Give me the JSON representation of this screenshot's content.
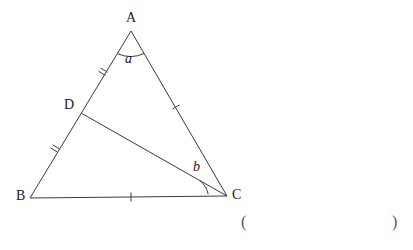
{
  "figure": {
    "kind": "geometry-triangle-diagram",
    "background_color": "#ffffff",
    "stroke_color": "#3a3a3a",
    "text_color": "#1a1a1a",
    "vertices": [
      {
        "name": "A",
        "label": "A",
        "x": 131,
        "y": 31
      },
      {
        "name": "B",
        "label": "B",
        "x": 30,
        "y": 198
      },
      {
        "name": "C",
        "label": "C",
        "x": 227,
        "y": 196
      },
      {
        "name": "D",
        "label": "D",
        "x": 81,
        "y": 113
      }
    ],
    "segments": [
      {
        "name": "AB",
        "from": "A",
        "to": "B"
      },
      {
        "name": "AC",
        "from": "A",
        "to": "C"
      },
      {
        "name": "BC",
        "from": "B",
        "to": "C"
      },
      {
        "name": "DC",
        "from": "D",
        "to": "C"
      }
    ],
    "tick_marks": [
      {
        "name": "tick-AD",
        "segment": "AD",
        "count": 2,
        "x": 103,
        "y": 74
      },
      {
        "name": "tick-DB",
        "segment": "DB",
        "count": 2,
        "x": 55,
        "y": 151
      },
      {
        "name": "tick-AC",
        "segment": "AC",
        "count": 1,
        "x": 176,
        "y": 106
      },
      {
        "name": "tick-BC",
        "segment": "BC",
        "count": 1,
        "x": 131,
        "y": 197
      }
    ],
    "angles": [
      {
        "name": "angle-a",
        "label": "a",
        "vertex": "A",
        "label_x": 125,
        "label_y": 52
      },
      {
        "name": "angle-b",
        "label": "b",
        "vertex": "C",
        "label_x": 193,
        "label_y": 160
      }
    ],
    "annotation": {
      "paren_open": "(",
      "paren_close": ")"
    }
  }
}
